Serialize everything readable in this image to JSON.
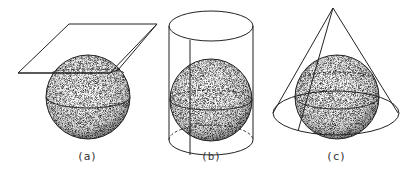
{
  "figure": {
    "panels": [
      {
        "label": "(a)",
        "description": "sphere with tangent plane"
      },
      {
        "label": "(b)",
        "description": "sphere inscribed in cylinder"
      },
      {
        "label": "(c)",
        "description": "sphere inscribed in cone"
      }
    ]
  },
  "colors": {
    "stroke": "#222222",
    "sphere_fill": "#cfcfcf",
    "background": "#ffffff"
  }
}
